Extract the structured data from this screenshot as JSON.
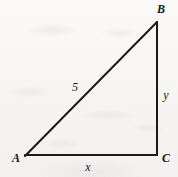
{
  "figure": {
    "kind": "geometry-diagram",
    "shape": "right-triangle",
    "background_color": "#f7f6f5",
    "stroke_color": "#1a1a1a",
    "stroke_width": 2,
    "right_angle_at": "C",
    "vertices": [
      {
        "id": "A",
        "label": "A",
        "x": 25,
        "y": 156
      },
      {
        "id": "B",
        "label": "B",
        "x": 157,
        "y": 22
      },
      {
        "id": "C",
        "label": "C",
        "x": 157,
        "y": 155
      }
    ],
    "sides": [
      {
        "id": "AB",
        "label": "5",
        "role": "hypotenuse",
        "from": "A",
        "to": "B"
      },
      {
        "id": "BC",
        "label": "y",
        "role": "vertical-leg",
        "from": "B",
        "to": "C"
      },
      {
        "id": "AC",
        "label": "x",
        "role": "horizontal-leg",
        "from": "A",
        "to": "C"
      }
    ],
    "labels": {
      "vertex_A": "A",
      "vertex_B": "B",
      "vertex_C": "C",
      "side_hypotenuse": "5",
      "side_vertical": "y",
      "side_horizontal": "x"
    }
  }
}
